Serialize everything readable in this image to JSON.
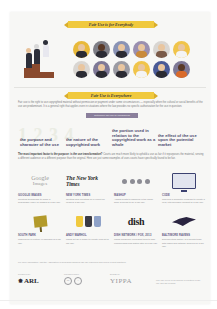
{
  "section1": {
    "banner": "Fair Use is for Everybody"
  },
  "avatars": {
    "colors": [
      "#e8b93a",
      "#7e7e86",
      "#8a93b5",
      "#9a8fb0",
      "#d9d6d2",
      "#f0c44a",
      "#d9d6d2",
      "#7e7896",
      "#9b9ba3",
      "#f0c44a",
      "#4a5a96",
      "#7e7896"
    ]
  },
  "section2": {
    "banner": "Fair Use is Everywhere",
    "intro": "Fair use is the right to use copyrighted material without permission or payment under some circumstances — especially when the cultural or social benefits of the use are predominant. It is a general right that applies even in situations where the law provides no specific authorization for the use in question.",
    "tab_label": "Determine fair use by considering",
    "factors": [
      "the purpose and character of the use",
      "the nature of the copyrighted work",
      "the portion used in relation to the copyrighted work as a whole",
      "the effect of the use upon the potential market"
    ],
    "para_bold": "The most important factor is the purpose: is the use transformative?",
    "para_rest": " Courts are much more likely to uphold a use as fair if it repurposes the material, serving a different audience or a different purpose than the original. Here are just some examples of uses courts have specifically found to be fair."
  },
  "examples": [
    {
      "logo": "google-images",
      "title": "GOOGLE IMAGES",
      "desc": "Creating thumbnails to make a searchable index of images is a fair use."
    },
    {
      "logo": "nyt",
      "title": "NEW YORK TIMES",
      "desc": "Quoting and reporting on a report for news is a fair use."
    },
    {
      "logo": "dots",
      "title": "MASHUP",
      "desc": "Adding beats to samples in the same work is found to be a fair use."
    },
    {
      "logo": "monitor",
      "title": "CODE",
      "desc": "Copying a computer program to create a new, interoperable product is a fair use."
    },
    {
      "logo": "signpost",
      "title": "SOUTH PARK",
      "desc": "Making fun of culture in parodies is a fair use."
    },
    {
      "logo": "cups",
      "title": "ANDY WARHOL",
      "desc": "Using art as a model to create new art is fair use."
    },
    {
      "logo": "dish",
      "title": "DISH NETWORK / FOX, 2013",
      "desc": "Using consumer recording tools to skip commercials and watch later is a fair use."
    },
    {
      "logo": "raven",
      "title": "BALTIMORE RAVENS",
      "desc": "Documenting history of a sports team with logos and artwork archives is a fair use."
    }
  ],
  "examples_logo_text": {
    "google": "Google",
    "images": "Images",
    "nyt": "The New York Times",
    "dish": "dish"
  },
  "footnote": "For more information, visit the Association of Research Libraries' fair use resources and codes of best practices.",
  "footer": {
    "arl_label": "Produced by",
    "arl": "ARL",
    "cc_label": "Licensed under",
    "cc": [
      "cc",
      "i"
    ],
    "yippa_label": "Design by",
    "yippa": "YIPPA",
    "credit": "Fair Use Week is an annual celebration of fair use and fair dealing."
  },
  "colors": {
    "banner_yellow": "#f0c93e",
    "purple_tab": "#8a7f9b",
    "factor_text": "#4e4a6e",
    "podium": "#8a4a2e"
  }
}
